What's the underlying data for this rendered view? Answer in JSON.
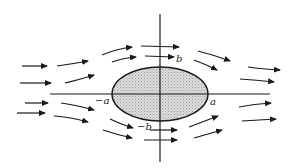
{
  "diagram": {
    "type": "flow-around-ellipse",
    "colors": {
      "stroke": "#1a1a1a",
      "ellipse_fill": "#d4d4d4",
      "background": "#ffffff"
    },
    "labels": {
      "b_top": "b",
      "b_bottom": "−b",
      "a_left": "−a",
      "a_right": "a"
    },
    "ellipse": {
      "cx": 160,
      "cy": 94,
      "rx": 48,
      "ry": 27
    },
    "axes": {
      "horizontal": {
        "x1": 50,
        "x2": 270,
        "y": 94
      },
      "vertical": {
        "x": 160,
        "y1": 14,
        "y2": 162
      }
    }
  }
}
